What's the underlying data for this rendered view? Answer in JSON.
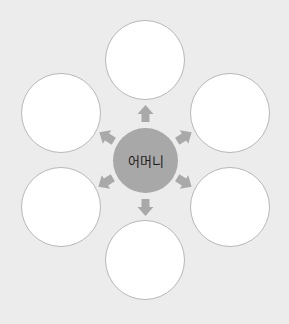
{
  "diagram": {
    "center": {
      "label": "어머니",
      "fill": "#a8a8a8"
    },
    "nodes": [
      {
        "position": "top",
        "label": ""
      },
      {
        "position": "upper-left",
        "label": ""
      },
      {
        "position": "upper-right",
        "label": ""
      },
      {
        "position": "lower-left",
        "label": ""
      },
      {
        "position": "lower-right",
        "label": ""
      },
      {
        "position": "bottom",
        "label": ""
      }
    ],
    "colors": {
      "background": "#ececec",
      "node_fill": "#ffffff",
      "node_border": "#b8b8b8",
      "arrow": "#a9a9a9"
    }
  }
}
